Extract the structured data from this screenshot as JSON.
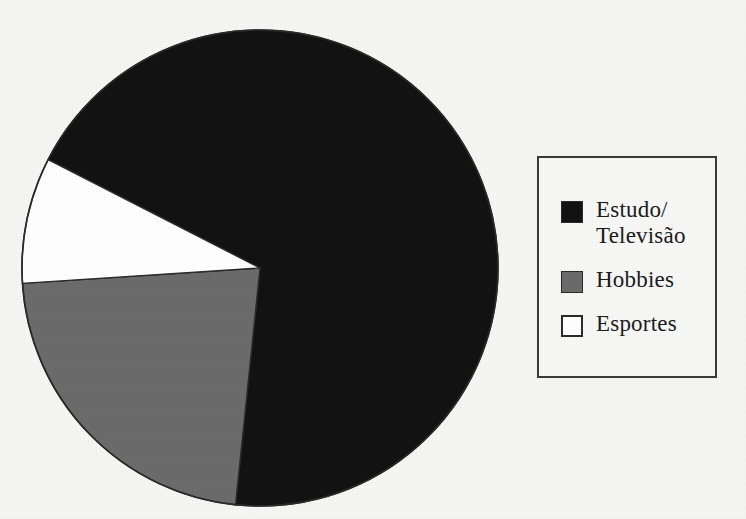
{
  "figure": {
    "background_color": "#f5f5f4",
    "outline_color": "#2a2a2a"
  },
  "legend": {
    "position": "right",
    "border_color": "#3a3a3a",
    "entries": [
      {
        "label": "Estudo/\nTelevisão",
        "swatch_style": "filled",
        "color": "#121212",
        "icon": "filled-square-black-swatch"
      },
      {
        "label": "Hobbies",
        "swatch_style": "filled",
        "color": "#6b6b6b",
        "icon": "filled-square-gray-swatch"
      },
      {
        "label": "Esportes",
        "swatch_style": "outlined",
        "color": "#ffffff",
        "icon": "outlined-square-white-swatch"
      }
    ]
  },
  "chart_data": {
    "type": "pie",
    "title": "",
    "xlabel": "",
    "ylabel": "",
    "grid": false,
    "legend_position": "right",
    "center": {
      "x": 260,
      "y": 268
    },
    "radius": 238,
    "start_angle_deg": 152.9,
    "direction": "clockwise",
    "categories": [
      "Estudo/Televisão",
      "Hobbies",
      "Esportes"
    ],
    "values": [
      69.1,
      22.3,
      8.6
    ],
    "value_unit": "percent",
    "angles_deg": [
      248.8,
      80.4,
      30.8
    ],
    "colors": [
      "#121212",
      "#6b6b6b",
      "#ffffff"
    ],
    "slices": [
      {
        "label": "Estudo/Televisão",
        "value": 69.1,
        "angle_deg": 248.8,
        "color": "#121212",
        "start_deg": 152.9,
        "end_deg": -95.9
      },
      {
        "label": "Hobbies",
        "value": 22.3,
        "angle_deg": 80.4,
        "color": "#6b6b6b",
        "start_deg": -95.9,
        "end_deg": -176.3
      },
      {
        "label": "Esportes",
        "value": 8.6,
        "angle_deg": 30.8,
        "color": "#ffffff",
        "start_deg": -176.3,
        "end_deg": 152.9
      }
    ]
  }
}
